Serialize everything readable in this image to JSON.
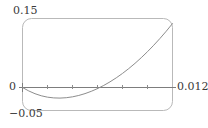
{
  "figure": {
    "kind": "mathematical-plot",
    "background_color": "#ffffff",
    "frame_color": "#b5b5b5",
    "axis_color": "#7a7a7a",
    "curve_color": "#8a8a8a",
    "text_color": "#3a3a3a"
  },
  "labels": {
    "y_max": "0.15",
    "y_min": "−0.05",
    "origin": "0",
    "x_max": "0.012"
  },
  "chart_data": {
    "type": "line",
    "title": "",
    "xlabel": "",
    "ylabel": "",
    "xlim": [
      0,
      0.012
    ],
    "ylim": [
      -0.05,
      0.15
    ],
    "grid": false,
    "legend": null,
    "axis_drawn": {
      "x_axis_at_y": 0,
      "y_axis_at_x": 0
    },
    "tick_labels": {
      "y": [
        "0.15",
        "0",
        "−0.05"
      ],
      "x": [
        "0",
        "0.012"
      ]
    },
    "x_tick_positions": [
      0.002,
      0.004,
      0.006,
      0.008,
      0.01
    ],
    "series": [
      {
        "name": "curve",
        "x": [
          0.0,
          0.0005,
          0.001,
          0.0015,
          0.002,
          0.0025,
          0.003,
          0.0035,
          0.004,
          0.0045,
          0.005,
          0.0055,
          0.006,
          0.0065,
          0.007,
          0.0075,
          0.008,
          0.0085,
          0.009,
          0.0095,
          0.01,
          0.0105,
          0.011,
          0.0115,
          0.012
        ],
        "y": [
          0.0,
          -0.0075,
          -0.0135,
          -0.018,
          -0.021,
          -0.0226,
          -0.023,
          -0.0222,
          -0.0203,
          -0.0173,
          -0.0133,
          -0.0083,
          -0.0024,
          0.0045,
          0.0123,
          0.021,
          0.0306,
          0.0411,
          0.0525,
          0.0648,
          0.0779,
          0.0919,
          0.1067,
          0.1224,
          0.139
        ]
      }
    ],
    "annotations": {
      "minimum_approx": {
        "x": 0.003,
        "y": -0.023
      },
      "zero_crossings": [
        0.0,
        0.0066
      ],
      "endpoint": {
        "x": 0.012,
        "y": 0.139
      }
    }
  }
}
